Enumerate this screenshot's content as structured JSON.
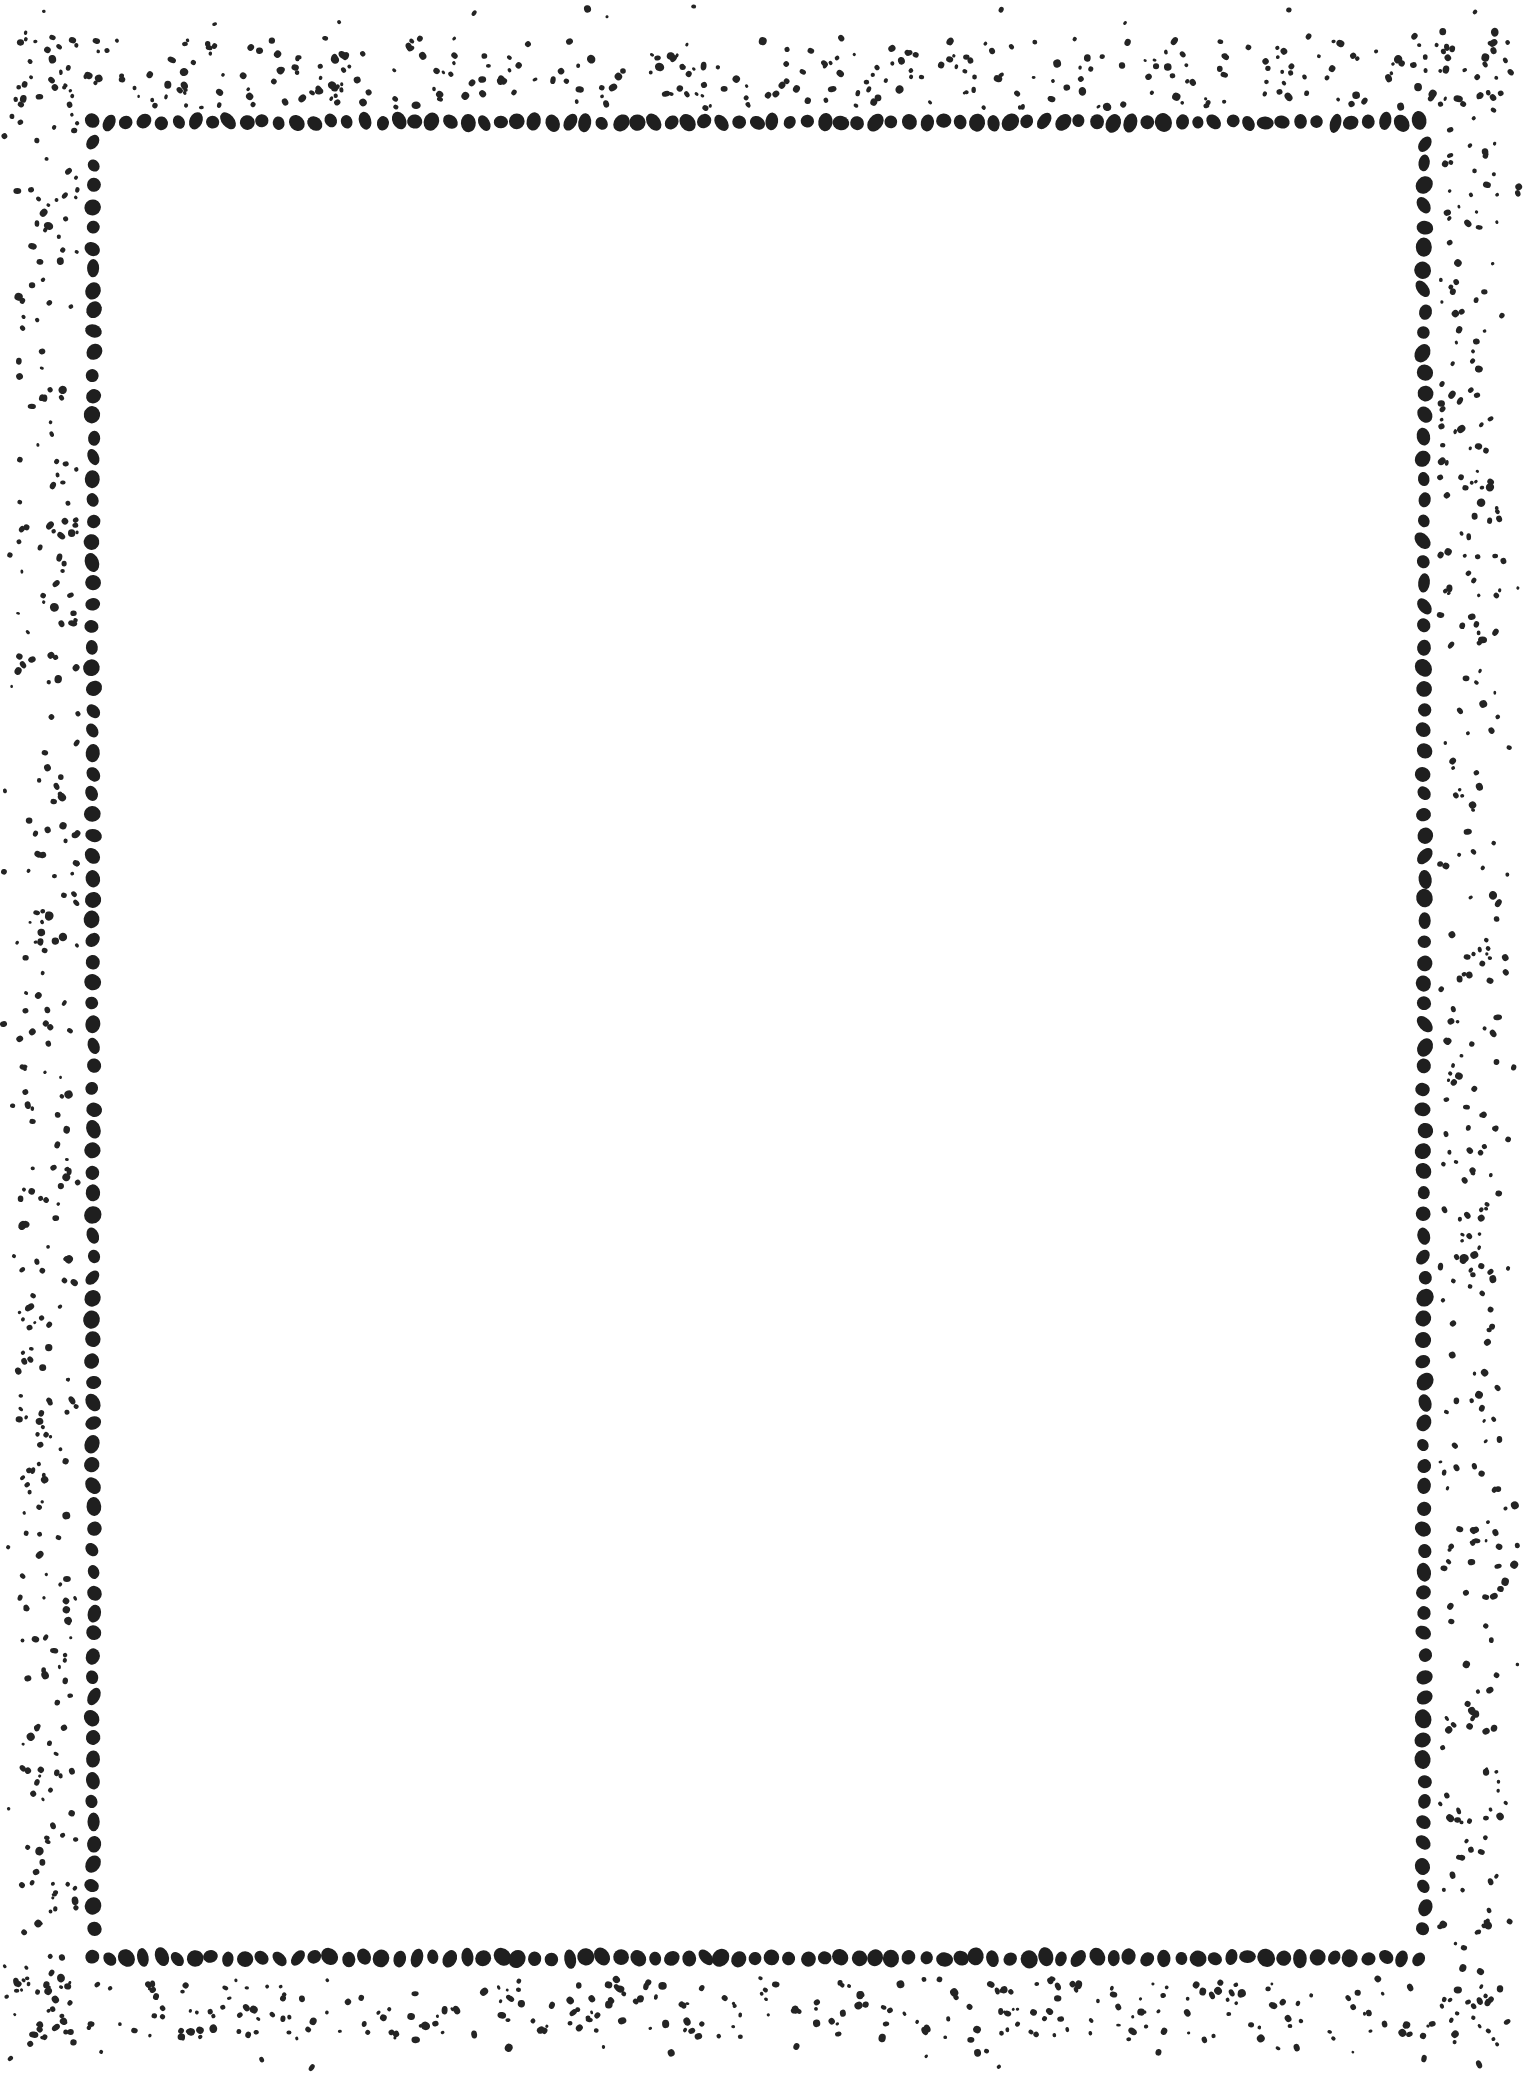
{
  "page": {
    "kind": "decorative-blank-border-page",
    "width": 1524,
    "height": 2074,
    "background_color": "#ffffff",
    "ink_color": "#1f1f1f",
    "body_text": ""
  },
  "border": {
    "name": "dotted-frame",
    "style": "hand-drawn dotted rectangle with scattered speckle band",
    "main_line": {
      "color": "#1f1f1f",
      "left_x": 93,
      "top_y": 122,
      "right_x": 1424,
      "bottom_y": 1958,
      "dot_width": 14,
      "dot_height": 16,
      "spacing_horizontal": 17,
      "spacing_vertical": 21
    },
    "speckle": {
      "color": "#242424",
      "min_dot": 3,
      "max_dot": 7,
      "band_outer_left": 18,
      "band_inner_left": 78,
      "band_outer_top": 38,
      "band_inner_top": 108,
      "band_inner_right": 1440,
      "band_outer_right": 1500,
      "band_inner_bottom": 1978,
      "band_outer_bottom": 2040,
      "approx_count": 900
    }
  },
  "content": {
    "empty_label": ""
  }
}
